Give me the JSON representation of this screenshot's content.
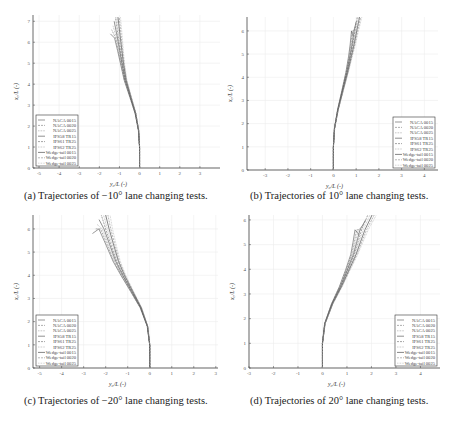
{
  "series_names": [
    "NACA 0015",
    "NACA 0020",
    "NACA 0025",
    "IFS58 TR15",
    "IFS61 TR25",
    "IFS62 TR25",
    "Wedge-tail 0015",
    "Wedge-tail 0020",
    "Wedge-tail 0025"
  ],
  "chart_data": [
    {
      "type": "line",
      "id": "a",
      "caption": "(a) Trajectories of −10° lane changing tests.",
      "xlabel": "y₀/L (-)",
      "ylabel": "x₀/L (-)",
      "xlim": [
        -5.3,
        4.0
      ],
      "ylim": [
        0,
        7.3
      ],
      "xticks": [
        -5,
        -4,
        -3,
        -2,
        -1,
        0,
        1,
        2,
        3
      ],
      "yticks": [
        0,
        1,
        2,
        3,
        4,
        5,
        6,
        7
      ],
      "grid": true,
      "legend_position": "lower left",
      "series_template": {
        "x": [
          0,
          0,
          -0.05,
          -0.2,
          -0.45,
          -0.7,
          -0.85,
          -0.95,
          -1.05,
          -1.2
        ],
        "y": [
          0,
          1,
          1.8,
          2.6,
          3.4,
          4.2,
          5.0,
          5.6,
          6.2,
          7.2
        ]
      },
      "spread_end": 0.25
    },
    {
      "type": "line",
      "id": "b",
      "caption": "(b) Trajectories of 10° lane changing tests.",
      "xlabel": "y₀/L (-)",
      "ylabel": "x₀/L (-)",
      "xlim": [
        -3.8,
        4.6
      ],
      "ylim": [
        0,
        6.6
      ],
      "xticks": [
        -3,
        -2,
        -1,
        0,
        1,
        2,
        3,
        4
      ],
      "yticks": [
        0,
        1,
        2,
        3,
        4,
        5,
        6
      ],
      "grid": true,
      "legend_position": "lower right",
      "series_template": {
        "x": [
          0,
          0,
          0.05,
          0.2,
          0.4,
          0.6,
          0.75,
          0.85,
          0.95,
          1.05
        ],
        "y": [
          0,
          1,
          1.8,
          2.6,
          3.4,
          4.2,
          4.9,
          5.4,
          6.0,
          6.6
        ]
      },
      "spread_end": 0.2
    },
    {
      "type": "line",
      "id": "c",
      "caption": "(c) Trajectories of −20° lane changing tests.",
      "xlabel": "y₀/L (-)",
      "ylabel": "x₀/L (-)",
      "xlim": [
        -5.3,
        3.1
      ],
      "ylim": [
        0,
        6.6
      ],
      "xticks": [
        -5,
        -4,
        -3,
        -2,
        -1,
        0,
        1,
        2,
        3
      ],
      "yticks": [
        0,
        1,
        2,
        3,
        4,
        5,
        6
      ],
      "grid": true,
      "legend_position": "lower left",
      "series_template": {
        "x": [
          0,
          0,
          -0.1,
          -0.4,
          -0.8,
          -1.2,
          -1.5,
          -1.75,
          -2.0,
          -2.2
        ],
        "y": [
          0,
          1,
          1.8,
          2.6,
          3.3,
          4.0,
          4.6,
          5.3,
          6.0,
          6.6
        ]
      },
      "spread_end": 0.4
    },
    {
      "type": "line",
      "id": "d",
      "caption": "(d) Trajectories of 20° lane changing tests.",
      "xlabel": "y₀/L (-)",
      "ylabel": "x₀/L (-)",
      "xlim": [
        -3.0,
        4.8
      ],
      "ylim": [
        0,
        6.2
      ],
      "xticks": [
        -3,
        -2,
        -1,
        0,
        1,
        2,
        3,
        4
      ],
      "yticks": [
        0,
        1,
        2,
        3,
        4,
        5,
        6
      ],
      "grid": true,
      "legend_position": "lower right",
      "series_template": {
        "x": [
          0,
          0,
          0.1,
          0.4,
          0.75,
          1.05,
          1.3,
          1.45,
          1.6,
          1.85
        ],
        "y": [
          0,
          1,
          1.8,
          2.6,
          3.3,
          4.0,
          4.6,
          5.1,
          5.6,
          6.2
        ]
      },
      "spread_end": 0.35
    }
  ]
}
